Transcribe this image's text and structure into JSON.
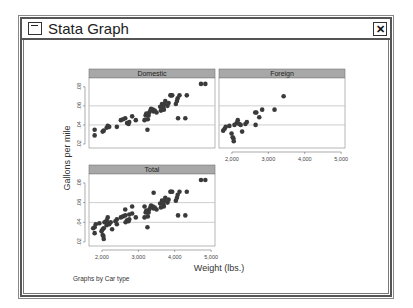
{
  "window": {
    "title": "Stata Graph",
    "close_label": "✕",
    "system_menu_icon": "system-menu-icon"
  },
  "chart_data": {
    "type": "scatter",
    "title": "",
    "ylabel": "Gallons per mile",
    "xlabel": "Weight (lbs.)",
    "note": "Graphs by Car type",
    "xlim": [
      1760,
      5000
    ],
    "ylim": [
      0.02,
      0.085
    ],
    "xticks": [
      "2,000",
      "3,000",
      "4,000",
      "5,000"
    ],
    "yticks": [
      ".02",
      ".04",
      ".06",
      ".08"
    ],
    "grid": "horizontal at .04, .06",
    "panels": [
      {
        "name": "Domestic",
        "points": [
          [
            1800,
            0.029
          ],
          [
            1800,
            0.035
          ],
          [
            2020,
            0.033
          ],
          [
            2050,
            0.034
          ],
          [
            2130,
            0.037
          ],
          [
            2160,
            0.039
          ],
          [
            2200,
            0.038
          ],
          [
            2410,
            0.038
          ],
          [
            2520,
            0.045
          ],
          [
            2580,
            0.046
          ],
          [
            2640,
            0.047
          ],
          [
            2690,
            0.042
          ],
          [
            2730,
            0.041
          ],
          [
            2750,
            0.043
          ],
          [
            2830,
            0.049
          ],
          [
            2930,
            0.045
          ],
          [
            3170,
            0.045
          ],
          [
            3200,
            0.05
          ],
          [
            3220,
            0.052
          ],
          [
            3250,
            0.035
          ],
          [
            3260,
            0.046
          ],
          [
            3280,
            0.05
          ],
          [
            3300,
            0.053
          ],
          [
            3330,
            0.055
          ],
          [
            3350,
            0.057
          ],
          [
            3400,
            0.056
          ],
          [
            3420,
            0.054
          ],
          [
            3450,
            0.055
          ],
          [
            3500,
            0.053
          ],
          [
            3600,
            0.059
          ],
          [
            3620,
            0.055
          ],
          [
            3650,
            0.062
          ],
          [
            3690,
            0.058
          ],
          [
            3700,
            0.056
          ],
          [
            3720,
            0.062
          ],
          [
            3740,
            0.065
          ],
          [
            3800,
            0.06
          ],
          [
            3830,
            0.063
          ],
          [
            3880,
            0.071
          ],
          [
            3900,
            0.071
          ],
          [
            3930,
            0.071
          ],
          [
            4030,
            0.062
          ],
          [
            4060,
            0.065
          ],
          [
            4080,
            0.068
          ],
          [
            4090,
            0.047
          ],
          [
            4130,
            0.071
          ],
          [
            4290,
            0.047
          ],
          [
            4330,
            0.071
          ],
          [
            4720,
            0.083
          ],
          [
            4840,
            0.083
          ]
        ]
      },
      {
        "name": "Foreign",
        "points": [
          [
            1760,
            0.034
          ],
          [
            1800,
            0.036
          ],
          [
            1830,
            0.038
          ],
          [
            1930,
            0.039
          ],
          [
            1990,
            0.031
          ],
          [
            2020,
            0.027
          ],
          [
            2040,
            0.026
          ],
          [
            2050,
            0.023
          ],
          [
            2070,
            0.04
          ],
          [
            2130,
            0.042
          ],
          [
            2160,
            0.045
          ],
          [
            2200,
            0.041
          ],
          [
            2240,
            0.04
          ],
          [
            2280,
            0.033
          ],
          [
            2370,
            0.041
          ],
          [
            2410,
            0.043
          ],
          [
            2640,
            0.053
          ],
          [
            2650,
            0.04
          ],
          [
            2670,
            0.053
          ],
          [
            2750,
            0.048
          ],
          [
            2830,
            0.056
          ],
          [
            3170,
            0.056
          ],
          [
            3420,
            0.07
          ]
        ]
      },
      {
        "name": "Total",
        "points": [
          [
            1760,
            0.034
          ],
          [
            1800,
            0.029
          ],
          [
            1800,
            0.035
          ],
          [
            1830,
            0.038
          ],
          [
            1930,
            0.039
          ],
          [
            1990,
            0.031
          ],
          [
            2020,
            0.027
          ],
          [
            2020,
            0.033
          ],
          [
            2040,
            0.026
          ],
          [
            2050,
            0.023
          ],
          [
            2050,
            0.034
          ],
          [
            2070,
            0.04
          ],
          [
            2130,
            0.037
          ],
          [
            2130,
            0.042
          ],
          [
            2160,
            0.045
          ],
          [
            2160,
            0.039
          ],
          [
            2200,
            0.038
          ],
          [
            2240,
            0.04
          ],
          [
            2280,
            0.033
          ],
          [
            2370,
            0.041
          ],
          [
            2410,
            0.038
          ],
          [
            2410,
            0.043
          ],
          [
            2520,
            0.045
          ],
          [
            2580,
            0.046
          ],
          [
            2640,
            0.053
          ],
          [
            2640,
            0.047
          ],
          [
            2650,
            0.04
          ],
          [
            2690,
            0.042
          ],
          [
            2730,
            0.041
          ],
          [
            2750,
            0.048
          ],
          [
            2750,
            0.043
          ],
          [
            2830,
            0.056
          ],
          [
            2830,
            0.049
          ],
          [
            2930,
            0.045
          ],
          [
            3170,
            0.056
          ],
          [
            3170,
            0.045
          ],
          [
            3200,
            0.05
          ],
          [
            3220,
            0.052
          ],
          [
            3250,
            0.035
          ],
          [
            3260,
            0.046
          ],
          [
            3280,
            0.05
          ],
          [
            3300,
            0.053
          ],
          [
            3330,
            0.055
          ],
          [
            3350,
            0.057
          ],
          [
            3400,
            0.056
          ],
          [
            3420,
            0.07
          ],
          [
            3420,
            0.054
          ],
          [
            3450,
            0.055
          ],
          [
            3500,
            0.053
          ],
          [
            3600,
            0.059
          ],
          [
            3620,
            0.055
          ],
          [
            3650,
            0.062
          ],
          [
            3690,
            0.058
          ],
          [
            3700,
            0.056
          ],
          [
            3720,
            0.062
          ],
          [
            3740,
            0.065
          ],
          [
            3800,
            0.06
          ],
          [
            3830,
            0.063
          ],
          [
            3880,
            0.071
          ],
          [
            3900,
            0.071
          ],
          [
            3930,
            0.071
          ],
          [
            4030,
            0.062
          ],
          [
            4060,
            0.065
          ],
          [
            4080,
            0.068
          ],
          [
            4090,
            0.047
          ],
          [
            4130,
            0.071
          ],
          [
            4290,
            0.047
          ],
          [
            4330,
            0.071
          ],
          [
            4720,
            0.083
          ],
          [
            4840,
            0.083
          ]
        ]
      }
    ]
  },
  "colors": {
    "marker": "#3a3a3a",
    "header_fill": "#a8a8a8",
    "grid": "#b8b8b8",
    "axis": "#555555"
  }
}
